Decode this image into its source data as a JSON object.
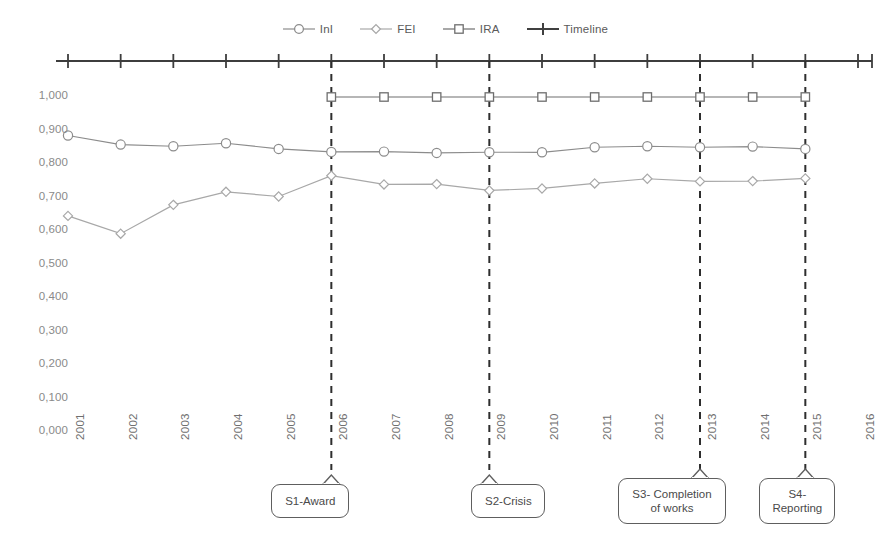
{
  "legend": {
    "items": [
      {
        "label": "InI",
        "marker": "circle-marker-icon",
        "color": "#8c8c8c"
      },
      {
        "label": "FEI",
        "marker": "diamond-marker-icon",
        "color": "#a8a8a8"
      },
      {
        "label": "IRA",
        "marker": "square-marker-icon",
        "color": "#6e6e6e"
      },
      {
        "label": "Timeline",
        "marker": "plus-marker-icon",
        "color": "#404040"
      }
    ]
  },
  "chart_data": {
    "type": "line",
    "title": "",
    "xlabel": "",
    "ylabel": "",
    "ylim": [
      0.0,
      1.0
    ],
    "xlim": [
      "2001",
      "2016"
    ],
    "grid": false,
    "legend_position": "top-center",
    "decimal_separator": ",",
    "categories": [
      "2001",
      "2002",
      "2003",
      "2004",
      "2005",
      "2006",
      "2007",
      "2008",
      "2009",
      "2010",
      "2011",
      "2012",
      "2013",
      "2014",
      "2015",
      "2016"
    ],
    "ytick_labels": [
      "0,000",
      "0,100",
      "0,200",
      "0,300",
      "0,400",
      "0,500",
      "0,600",
      "0,700",
      "0,800",
      "0,900",
      "1,000"
    ],
    "ytick_values": [
      0.0,
      0.1,
      0.2,
      0.3,
      0.4,
      0.5,
      0.6,
      0.7,
      0.8,
      0.9,
      1.0
    ],
    "series": [
      {
        "name": "InI",
        "marker": "circle",
        "color": "#8c8c8c",
        "x": [
          "2001",
          "2002",
          "2003",
          "2004",
          "2005",
          "2006",
          "2007",
          "2008",
          "2009",
          "2010",
          "2011",
          "2012",
          "2013",
          "2014",
          "2015"
        ],
        "values": [
          0.885,
          0.858,
          0.853,
          0.862,
          0.845,
          0.836,
          0.837,
          0.833,
          0.835,
          0.835,
          0.85,
          0.853,
          0.85,
          0.852,
          0.845
        ]
      },
      {
        "name": "FEI",
        "marker": "diamond",
        "color": "#a8a8a8",
        "x": [
          "2001",
          "2002",
          "2003",
          "2004",
          "2005",
          "2006",
          "2007",
          "2008",
          "2009",
          "2010",
          "2011",
          "2012",
          "2013",
          "2014",
          "2015"
        ],
        "values": [
          0.645,
          0.592,
          0.678,
          0.717,
          0.703,
          0.765,
          0.739,
          0.74,
          0.721,
          0.727,
          0.742,
          0.756,
          0.748,
          0.749,
          0.757
        ]
      },
      {
        "name": "IRA",
        "marker": "square",
        "color": "#6e6e6e",
        "x": [
          "2006",
          "2007",
          "2008",
          "2009",
          "2010",
          "2011",
          "2012",
          "2013",
          "2014",
          "2015"
        ],
        "values": [
          1.0,
          1.0,
          1.0,
          1.0,
          1.0,
          1.0,
          1.0,
          1.0,
          1.0,
          1.0
        ]
      },
      {
        "name": "Timeline",
        "marker": "plus",
        "color": "#404040",
        "axis": "top",
        "x": [
          "2001",
          "2002",
          "2003",
          "2004",
          "2005",
          "2006",
          "2007",
          "2008",
          "2009",
          "2010",
          "2011",
          "2012",
          "2013",
          "2014",
          "2015",
          "2016"
        ],
        "values": [
          null,
          null,
          null,
          null,
          null,
          null,
          null,
          null,
          null,
          null,
          null,
          null,
          null,
          null,
          null,
          null
        ]
      }
    ],
    "annotations": [
      {
        "label": "S1-Award",
        "year": "2006",
        "lines": [
          "S1-Award"
        ]
      },
      {
        "label": "S2-Crisis",
        "year": "2009",
        "lines": [
          "S2-Crisis"
        ]
      },
      {
        "label": "S3- Completion of works",
        "year": "2013",
        "lines": [
          "S3- Completion",
          "of works"
        ]
      },
      {
        "label": "S4- Reporting",
        "year": "2015",
        "lines": [
          "S4-",
          "Reporting"
        ]
      }
    ]
  }
}
